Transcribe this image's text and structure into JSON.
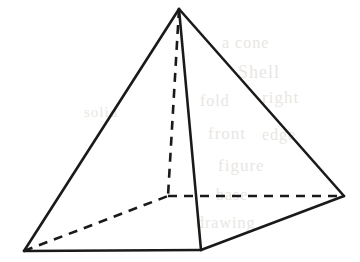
{
  "figure": {
    "background_color": "#ffffff",
    "stroke_color": "#1a1a1a",
    "solid_stroke_width": 2.6,
    "dashed_stroke_width": 2.6,
    "dash_pattern": "9 7",
    "canvas": {
      "width": 360,
      "height": 262
    }
  },
  "vertices": {
    "apex": {
      "name": "apex",
      "x": 179,
      "y": 9,
      "hidden": false
    },
    "front": {
      "name": "front-bottom-vertex",
      "x": 201,
      "y": 250,
      "hidden": false
    },
    "left": {
      "name": "left-bottom-vertex",
      "x": 24,
      "y": 251,
      "hidden": false
    },
    "right": {
      "name": "right-bottom-vertex",
      "x": 344,
      "y": 196,
      "hidden": false
    },
    "back": {
      "name": "back-hidden-vertex",
      "x": 168,
      "y": 196,
      "hidden": true
    }
  },
  "edges": [
    {
      "id": "apex-to-left",
      "from": "apex",
      "to": "left",
      "style": "solid",
      "label": "left lateral edge"
    },
    {
      "id": "apex-to-right",
      "from": "apex",
      "to": "right",
      "style": "solid",
      "label": "right lateral edge"
    },
    {
      "id": "apex-to-front",
      "from": "apex",
      "to": "front",
      "style": "solid",
      "label": "front lateral edge"
    },
    {
      "id": "left-to-front",
      "from": "left",
      "to": "front",
      "style": "solid",
      "label": "front-left base edge"
    },
    {
      "id": "front-to-right",
      "from": "front",
      "to": "right",
      "style": "solid",
      "label": "front-right base edge"
    },
    {
      "id": "apex-to-back",
      "from": "apex",
      "to": "back",
      "style": "dashed",
      "label": "hidden altitude / back lateral edge"
    },
    {
      "id": "left-to-back",
      "from": "left",
      "to": "back",
      "style": "dashed",
      "label": "hidden back-left base edge"
    },
    {
      "id": "back-to-right",
      "from": "back",
      "to": "right",
      "style": "dashed",
      "label": "hidden back-right base edge"
    }
  ],
  "background_ghosts": [
    {
      "text": "a cone",
      "x": 222,
      "y": 34,
      "size": 16
    },
    {
      "text": "Shell",
      "x": 238,
      "y": 62,
      "size": 18
    },
    {
      "text": "right",
      "x": 262,
      "y": 88,
      "size": 17
    },
    {
      "text": "fold",
      "x": 200,
      "y": 92,
      "size": 16
    },
    {
      "text": "front",
      "x": 208,
      "y": 124,
      "size": 17
    },
    {
      "text": "edge",
      "x": 262,
      "y": 126,
      "size": 16
    },
    {
      "text": "figure",
      "x": 218,
      "y": 156,
      "size": 17
    },
    {
      "text": "base",
      "x": 216,
      "y": 186,
      "size": 16
    },
    {
      "text": "drawing",
      "x": 196,
      "y": 214,
      "size": 16
    },
    {
      "text": "solid",
      "x": 84,
      "y": 104,
      "size": 15
    }
  ]
}
